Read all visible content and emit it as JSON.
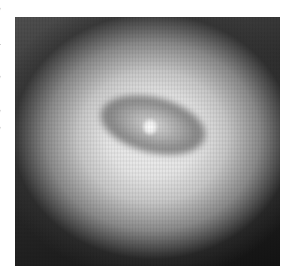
{
  "figure": {
    "palette": {
      "background": "#ffffff",
      "halo_center": "#f2f2f2",
      "ring_shadow": "#6e6e6e",
      "corner_dark": "#111111",
      "nucleus": "#ffffff"
    }
  },
  "edge_fragments": [
    "e",
    "s",
    "a",
    "l",
    "e",
    "r",
    "e",
    "",
    "",
    "",
    "",
    "",
    "e",
    "",
    "",
    "",
    ""
  ]
}
